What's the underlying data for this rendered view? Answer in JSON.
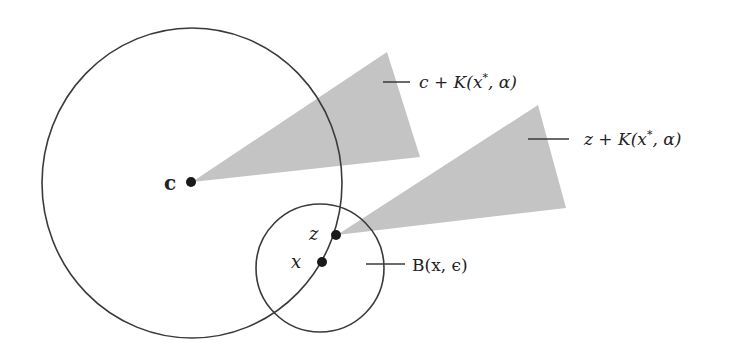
{
  "figure": {
    "colors": {
      "background": "#ffffff",
      "stroke": "#3a3a3a",
      "cone_fill": "#c4c4c4",
      "point": "#1a1a1a",
      "text": "#222222"
    },
    "circles": {
      "big": {
        "name": "Big circle",
        "cx": 192,
        "cy": 183,
        "rx": 150,
        "ry": 155
      },
      "small": {
        "name": "Ball B(x, epsilon)",
        "cx": 320,
        "cy": 268,
        "r": 64
      }
    },
    "cones": {
      "c_cone": {
        "apex": [
          192,
          182
        ],
        "v1": [
          387,
          52
        ],
        "v2": [
          420,
          157
        ]
      },
      "z_cone": {
        "apex": [
          337,
          235
        ],
        "v1": [
          538,
          105
        ],
        "v2": [
          566,
          208
        ]
      }
    },
    "points": {
      "c": {
        "label": "c",
        "x": 191,
        "y": 182
      },
      "z": {
        "label": "z",
        "x": 336,
        "y": 235
      },
      "x": {
        "label": "x",
        "x": 322,
        "y": 262
      }
    },
    "labels": {
      "c_cone_label": {
        "prefix": "c + K(x",
        "sup": "*",
        "suffix": ", α)"
      },
      "z_cone_label": {
        "prefix": "z + K(x",
        "sup": "*",
        "suffix": ", α)"
      },
      "ball_label": {
        "text": "B(x, ϵ)"
      }
    }
  }
}
